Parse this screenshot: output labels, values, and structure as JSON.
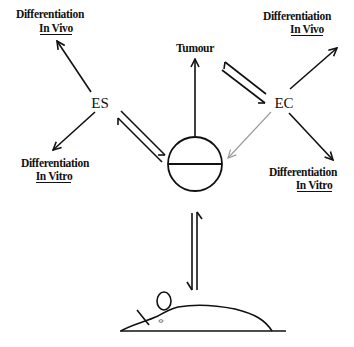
{
  "diagram": {
    "nodes": {
      "es": "ES",
      "ec": "EC",
      "tumour": "Tumour",
      "embryo": "Blastocyst (circle)",
      "mouse": "Mouse"
    },
    "labels": {
      "tl_line1": "Differentiation",
      "tl_line2": "In Vivo",
      "bl_line1": "Differentiation",
      "bl_line2": "In Vitro",
      "tr_line1": "Differentiation",
      "tr_line2": "In Vivo",
      "br_line1": "Differentiation",
      "br_line2": "In Vitro"
    },
    "edges": [
      {
        "from": "ES",
        "to": "Differentiation In Vivo",
        "type": "arrow"
      },
      {
        "from": "ES",
        "to": "Differentiation In Vitro",
        "type": "arrow"
      },
      {
        "from": "ES",
        "to": "Blastocyst",
        "type": "reversible"
      },
      {
        "from": "Blastocyst",
        "to": "Tumour",
        "type": "arrow"
      },
      {
        "from": "Blastocyst",
        "to": "EC",
        "type": "reversible"
      },
      {
        "from": "EC",
        "to": "Blastocyst",
        "type": "arrow-gray"
      },
      {
        "from": "EC",
        "to": "Differentiation In Vivo",
        "type": "arrow"
      },
      {
        "from": "EC",
        "to": "Differentiation In Vitro",
        "type": "arrow"
      },
      {
        "from": "Blastocyst",
        "to": "Mouse",
        "type": "reversible"
      }
    ],
    "colors": {
      "ink": "#111111",
      "gray_arrow": "#9a9a9a",
      "background": "#ffffff"
    }
  }
}
